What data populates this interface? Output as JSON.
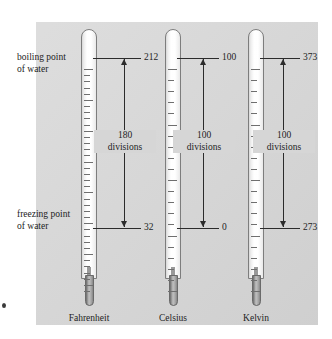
{
  "figure": {
    "background_panel_color": "#d6d6d6",
    "page_color": "#ffffff",
    "line_color": "#2b2b2b",
    "tube_outline_color": "#7d7d7d",
    "bulb_color": "#8e8e8e"
  },
  "annotations": {
    "boiling_label_line1": "boiling point",
    "boiling_label_line2": "of water",
    "freezing_label_line1": "freezing point",
    "freezing_label_line2": "of water"
  },
  "scales": [
    {
      "name": "Fahrenheit",
      "boiling_value": "212",
      "freezing_value": "32",
      "divisions_count": "180",
      "divisions_word": "divisions",
      "tick_count": 36
    },
    {
      "name": "Celsius",
      "boiling_value": "100",
      "freezing_value": "0",
      "divisions_count": "100",
      "divisions_word": "divisions",
      "tick_count": 20
    },
    {
      "name": "Kelvin",
      "boiling_value": "373",
      "freezing_value": "273",
      "divisions_count": "100",
      "divisions_word": "divisions",
      "tick_count": 20
    }
  ]
}
